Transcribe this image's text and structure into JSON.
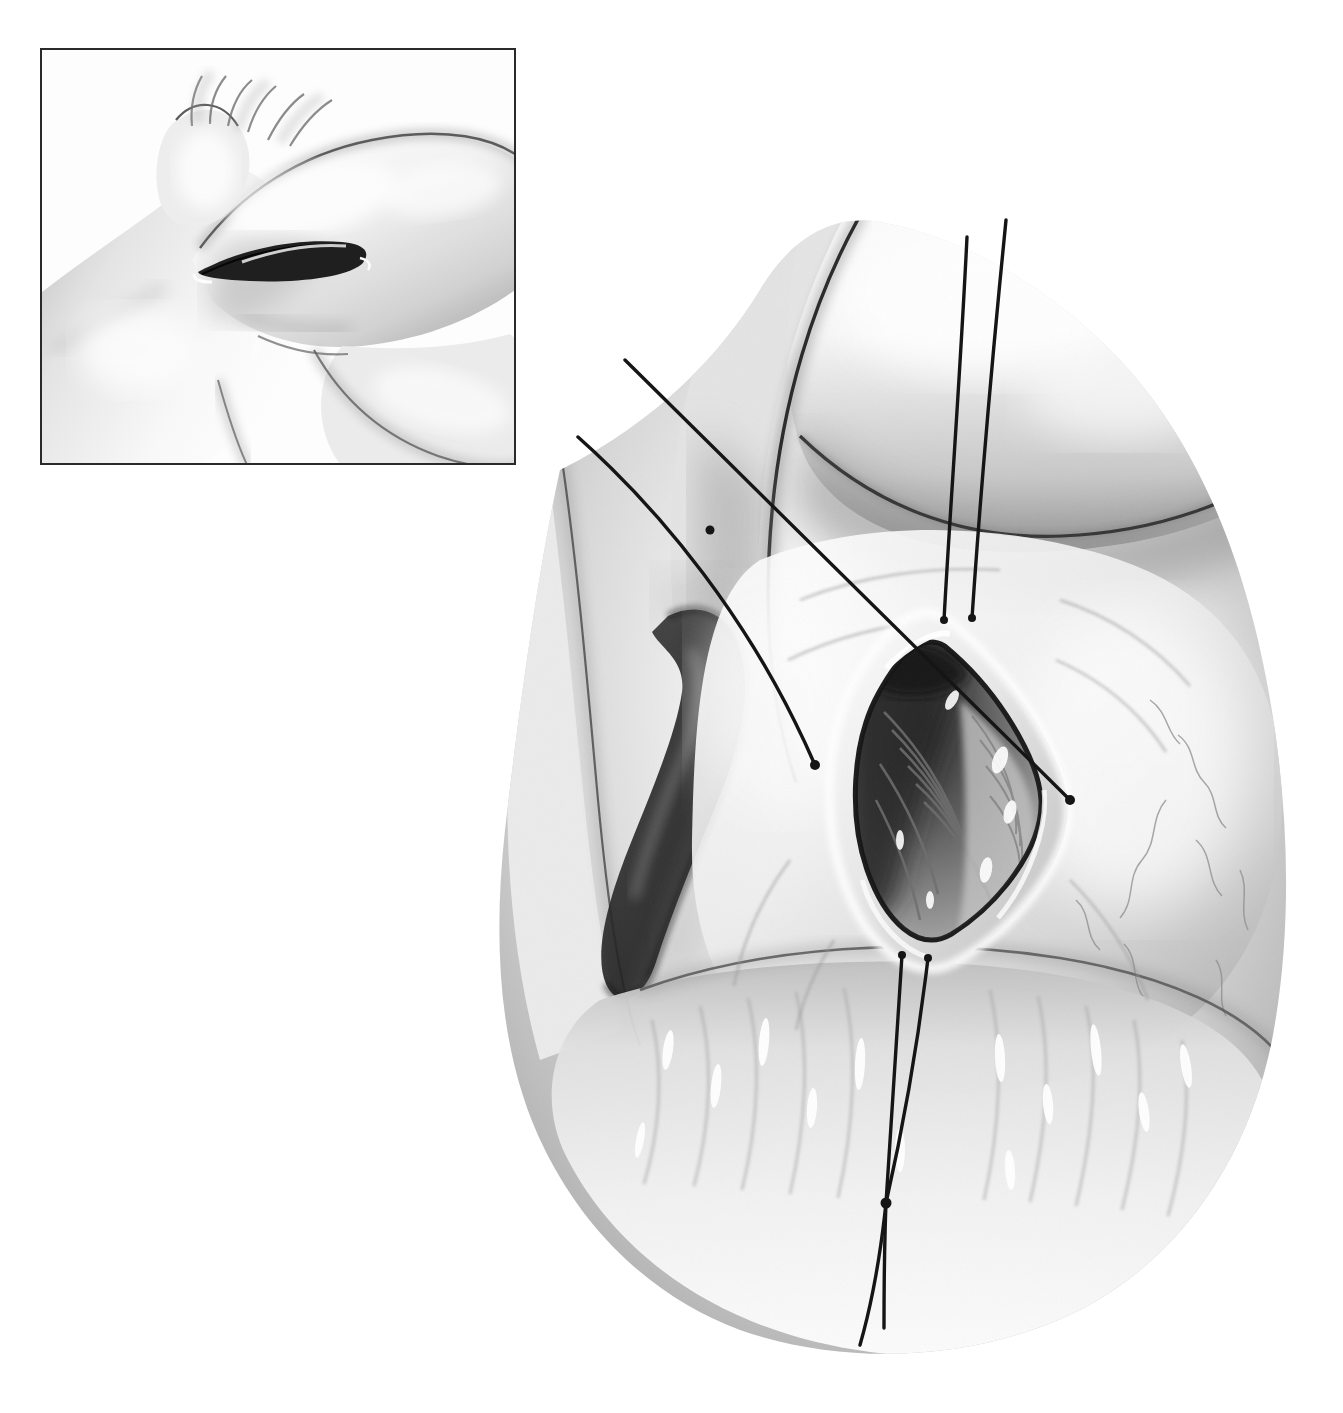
{
  "figure": {
    "style": "grayscale pencil and airbrush medical illustration",
    "background_color": "#ffffff",
    "ink_color": "#1a1a1a",
    "canvas": {
      "width": 1343,
      "height": 1413
    }
  },
  "inset": {
    "name": "external-view-inset",
    "bounds": {
      "x": 40,
      "y": 48,
      "width": 476,
      "height": 417
    },
    "border_color": "#2a2a2a",
    "border_width": 2.5,
    "subject": "abducted upper arm and shoulder showing axillary skin crease",
    "incision_mark": "dark lenticular skin incision line within the axillary crease"
  },
  "main_view": {
    "name": "operative-field",
    "subject": "axillary operative field, skin retracted to expose diamond-shaped wound",
    "wound": {
      "name": "diamond-wound-opening",
      "shape": "rhomboid / lenticular",
      "center": {
        "x": 945,
        "y": 790
      },
      "width": 200,
      "height": 300,
      "contents": "striated muscle fibers and deep tissue visible at base"
    },
    "sutures": [
      {
        "id": "suture-left-upper",
        "description": "long thread running from upper-left free end down to tissue bite left of wound",
        "start": {
          "x": 625,
          "y": 360
        },
        "end": {
          "x": 1070,
          "y": 800
        }
      },
      {
        "id": "suture-left-lower",
        "description": "long thread from upper-left free end crossing down to wound edge",
        "start": {
          "x": 578,
          "y": 437
        },
        "end": {
          "x": 815,
          "y": 765
        }
      },
      {
        "id": "suture-top-medial",
        "description": "vertical thread with free end at top, bite at superior wound apex",
        "start": {
          "x": 967,
          "y": 237
        },
        "end": {
          "x": 944,
          "y": 620
        }
      },
      {
        "id": "suture-top-lateral",
        "description": "vertical thread with free end at top, bite at superior wound apex",
        "start": {
          "x": 1006,
          "y": 220
        },
        "end": {
          "x": 972,
          "y": 618
        }
      },
      {
        "id": "suture-bottom-medial",
        "description": "vertical thread from inferior wound apex running down, knotted",
        "start": {
          "x": 902,
          "y": 955
        },
        "end": {
          "x": 860,
          "y": 1345
        }
      },
      {
        "id": "suture-bottom-lateral",
        "description": "vertical thread from inferior wound apex running down, knotted",
        "start": {
          "x": 928,
          "y": 958
        },
        "end": {
          "x": 884,
          "y": 1328
        }
      }
    ],
    "knots": [
      {
        "id": "knot-thread-crossing-upper",
        "x": 710,
        "y": 530
      },
      {
        "id": "knot-inferior-suture",
        "x": 886,
        "y": 1203
      }
    ],
    "tissue_bite_points": [
      {
        "id": "bite-superior-medial",
        "x": 944,
        "y": 620
      },
      {
        "id": "bite-superior-lateral",
        "x": 972,
        "y": 618
      },
      {
        "id": "bite-lateral-right",
        "x": 1070,
        "y": 800
      },
      {
        "id": "bite-medial-left",
        "x": 815,
        "y": 765
      },
      {
        "id": "bite-inferior-medial",
        "x": 902,
        "y": 955
      },
      {
        "id": "bite-inferior-lateral",
        "x": 928,
        "y": 958
      }
    ]
  },
  "labels": {
    "none_present": "This illustration contains no printed text, captions, or callout labels."
  }
}
